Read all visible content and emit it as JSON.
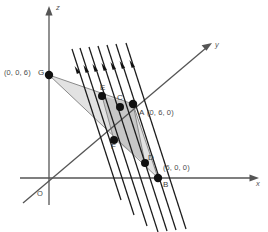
{
  "figure": {
    "background_color": "#ffffff",
    "axes": [
      {
        "id": "z",
        "label": "z",
        "label_x": 56,
        "label_y": 5
      },
      {
        "id": "y",
        "label": "y",
        "label_x": 215,
        "label_y": 43
      },
      {
        "id": "x",
        "label": "x",
        "label_x": 256,
        "label_y": 179
      }
    ],
    "origin": {
      "label": "O",
      "label_x": 37,
      "label_y": 191
    },
    "points": [
      {
        "id": "G",
        "name": "G",
        "coord_text": "(0, 0, 6)",
        "dot_x": 49,
        "dot_y": 75,
        "coord_label_x": 4,
        "coord_label_y": 70,
        "name_label_x": 38,
        "name_label_y": 70
      },
      {
        "id": "A",
        "name": "A",
        "coord_text": "(0, 6, 0)",
        "dot_x": 133,
        "dot_y": 104,
        "coord_label_x": 148,
        "coord_label_y": 110,
        "name_label_x": 139,
        "name_label_y": 110
      },
      {
        "id": "B",
        "name": "B",
        "coord_text": "(6, 0, 0)",
        "dot_x": 158,
        "dot_y": 178,
        "coord_label_x": 163,
        "coord_label_y": 165,
        "name_label_x": 163,
        "name_label_y": 182
      },
      {
        "id": "C",
        "name": "C",
        "coord_text": "",
        "dot_x": 120,
        "dot_y": 107,
        "coord_label_x": 0,
        "coord_label_y": 0,
        "name_label_x": 117,
        "name_label_y": 95
      },
      {
        "id": "D",
        "name": "D",
        "coord_text": "",
        "dot_x": 145,
        "dot_y": 163,
        "coord_label_x": 0,
        "coord_label_y": 0,
        "name_label_x": 148,
        "name_label_y": 155
      },
      {
        "id": "E",
        "name": "E",
        "coord_text": "",
        "dot_x": 102,
        "dot_y": 96,
        "coord_label_x": 0,
        "coord_label_y": 0,
        "name_label_x": 100,
        "name_label_y": 85
      },
      {
        "id": "F",
        "name": "F",
        "coord_text": "",
        "dot_x": 114,
        "dot_y": 140,
        "coord_label_x": 0,
        "coord_label_y": 0,
        "name_label_x": 111,
        "name_label_y": 143
      }
    ],
    "colors": {
      "axis": "#555555",
      "hatch": "#1b1b1b",
      "triangle_fill": "#d8d8d8",
      "inner_fill": "#c2c2c2",
      "dot": "#111111",
      "text": "#4a4a4a"
    }
  }
}
